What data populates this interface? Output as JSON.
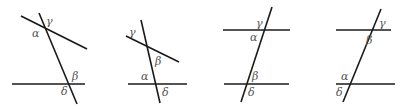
{
  "figure": {
    "panels": [
      {
        "id": "panel-1",
        "description": "two non-parallel lines cut by a transversal",
        "lines": [
          {
            "x1": 21,
            "y1": 16,
            "x2": 87,
            "y2": 49
          },
          {
            "x1": 39,
            "y1": 13,
            "x2": 77,
            "y2": 104
          },
          {
            "x1": 12,
            "y1": 84,
            "x2": 85,
            "y2": 84
          }
        ],
        "labels": [
          {
            "text": "γ",
            "x": 46,
            "y": 25
          },
          {
            "text": "α",
            "x": 32,
            "y": 37
          },
          {
            "text": "β",
            "x": 72,
            "y": 80
          },
          {
            "text": "δ",
            "x": 61,
            "y": 95
          }
        ]
      },
      {
        "id": "panel-2",
        "description": "two non-parallel lines cut by a transversal",
        "lines": [
          {
            "x1": 126,
            "y1": 36,
            "x2": 179,
            "y2": 62
          },
          {
            "x1": 141,
            "y1": 20,
            "x2": 160,
            "y2": 103
          },
          {
            "x1": 128,
            "y1": 84,
            "x2": 187,
            "y2": 84
          }
        ],
        "labels": [
          {
            "text": "γ",
            "x": 129,
            "y": 36
          },
          {
            "text": "β",
            "x": 155,
            "y": 65
          },
          {
            "text": "α",
            "x": 141,
            "y": 80
          },
          {
            "text": "δ",
            "x": 162,
            "y": 96
          }
        ]
      },
      {
        "id": "panel-3",
        "description": "two parallel lines cut by a transversal",
        "lines": [
          {
            "x1": 223,
            "y1": 30,
            "x2": 290,
            "y2": 30
          },
          {
            "x1": 272,
            "y1": 7,
            "x2": 241,
            "y2": 102
          },
          {
            "x1": 224,
            "y1": 84,
            "x2": 289,
            "y2": 84
          }
        ],
        "labels": [
          {
            "text": "γ",
            "x": 256,
            "y": 27
          },
          {
            "text": "α",
            "x": 250,
            "y": 41
          },
          {
            "text": "β",
            "x": 252,
            "y": 80
          },
          {
            "text": "δ",
            "x": 248,
            "y": 96
          }
        ]
      },
      {
        "id": "panel-4",
        "description": "two parallel lines cut by a transversal",
        "lines": [
          {
            "x1": 336,
            "y1": 30,
            "x2": 391,
            "y2": 30
          },
          {
            "x1": 381,
            "y1": 9,
            "x2": 343,
            "y2": 102
          },
          {
            "x1": 336,
            "y1": 84,
            "x2": 395,
            "y2": 84
          }
        ],
        "labels": [
          {
            "text": "γ",
            "x": 379,
            "y": 27
          },
          {
            "text": "β",
            "x": 366,
            "y": 44
          },
          {
            "text": "α",
            "x": 341,
            "y": 80
          },
          {
            "text": "δ",
            "x": 336,
            "y": 96
          }
        ]
      }
    ]
  }
}
